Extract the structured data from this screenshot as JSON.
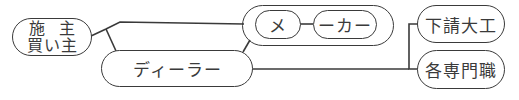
{
  "diagram": {
    "owner": {
      "line1": "施主",
      "line2": "買い主"
    },
    "maker": {
      "part1": "メ",
      "part2": "ーカー"
    },
    "dealer": {
      "label": "ディーラー"
    },
    "subcontractor": {
      "label": "下請大工"
    },
    "specialists": {
      "label": "各専門職"
    },
    "colors": {
      "stroke": "#3a3a3a",
      "background": "#ffffff"
    }
  }
}
